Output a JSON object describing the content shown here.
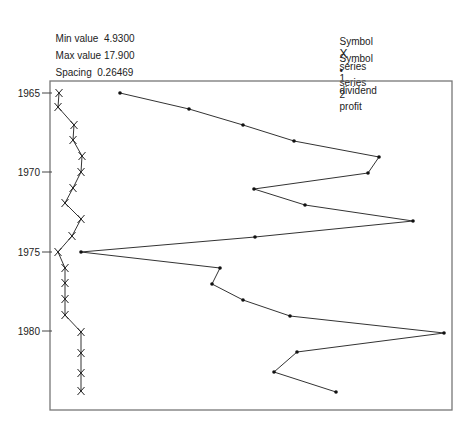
{
  "stats": {
    "min_label": "Min value",
    "min_value": "4.9300",
    "max_label": "Max value",
    "max_value": "17.900",
    "spacing_label": "Spacing",
    "spacing_value": "0.26469"
  },
  "legend": [
    {
      "prefix": "Symbol",
      "symbol": "X",
      "series_label": "series",
      "series_num": "1",
      "name": "dividend"
    },
    {
      "prefix": "Symbol",
      "symbol": "•",
      "series_label": "series",
      "series_num": "2",
      "name": "profit"
    }
  ],
  "chart_data": {
    "type": "line",
    "title": "",
    "xlabel": "",
    "ylabel": "",
    "orientation": "horizontal (years on vertical axis, values on horizontal axis)",
    "y_ticks": [
      "1965",
      "1970",
      "1975",
      "1980"
    ],
    "x_range": [
      4.93,
      17.9
    ],
    "grid": false,
    "legend_position": "top-right (text)",
    "years": [
      1965,
      1966,
      1967,
      1968,
      1969,
      1970,
      1971,
      1972,
      1973,
      1974,
      1975,
      1976,
      1977,
      1978,
      1979,
      1980,
      1981,
      1982,
      1983
    ],
    "series": [
      {
        "name": "dividend",
        "symbol": "X",
        "values": [
          4.96,
          4.93,
          5.47,
          5.43,
          5.74,
          5.7,
          5.43,
          5.17,
          5.7,
          5.4,
          4.93,
          5.17,
          5.17,
          5.17,
          5.17,
          5.7,
          5.7,
          5.7,
          5.7
        ],
        "px": [
          [
            59,
            93
          ],
          [
            58,
            107
          ],
          [
            74,
            125
          ],
          [
            73,
            140
          ],
          [
            82,
            156
          ],
          [
            81,
            172
          ],
          [
            73,
            188
          ],
          [
            65,
            203
          ],
          [
            81,
            219
          ],
          [
            72,
            236
          ],
          [
            58,
            252
          ],
          [
            65,
            268
          ],
          [
            65,
            283
          ],
          [
            65,
            299
          ],
          [
            65,
            315
          ],
          [
            81,
            332
          ],
          [
            81,
            353
          ],
          [
            81,
            373
          ],
          [
            81,
            391
          ]
        ]
      },
      {
        "name": "profit",
        "symbol": "•",
        "values": [
          7.01,
          9.33,
          11.15,
          12.86,
          15.72,
          15.35,
          11.52,
          13.23,
          16.86,
          11.55,
          5.7,
          10.37,
          10.1,
          11.15,
          12.73,
          17.9,
          12.96,
          12.19,
          14.27
        ],
        "px": [
          [
            120,
            93
          ],
          [
            189,
            109
          ],
          [
            243,
            125
          ],
          [
            294,
            141
          ],
          [
            379,
            157
          ],
          [
            368,
            173
          ],
          [
            254,
            189
          ],
          [
            305,
            205
          ],
          [
            413,
            221
          ],
          [
            255,
            237
          ],
          [
            81,
            252
          ],
          [
            220,
            268
          ],
          [
            212,
            284
          ],
          [
            243,
            300
          ],
          [
            290,
            316
          ],
          [
            444,
            333
          ],
          [
            297,
            352
          ],
          [
            274,
            372
          ],
          [
            336,
            392
          ]
        ]
      }
    ],
    "y_tick_px": [
      93,
      172,
      252,
      331
    ],
    "frame": {
      "left": 50,
      "top": 81,
      "right": 452,
      "bottom": 410
    }
  }
}
